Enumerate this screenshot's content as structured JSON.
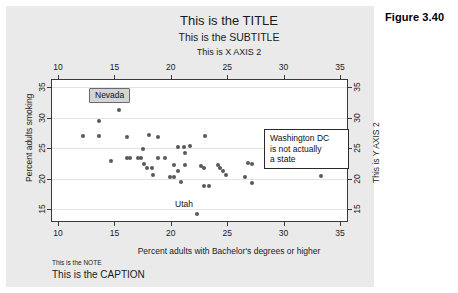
{
  "figure": {
    "number": "Figure 3.40",
    "title": "This is the TITLE",
    "subtitle": "This is the SUBTITLE",
    "note": "This is the NOTE",
    "caption": "This is the CAPTION"
  },
  "annotations": {
    "nevada": "Nevada",
    "utah": "Utah",
    "washington_dc": "Washington DC\nis not actually\na state",
    "washington_dc_lines": [
      "Washington DC",
      "is not actually",
      "a state"
    ]
  },
  "colors": {
    "panel_background": "#eaeaea",
    "plot_background": "#ffffff",
    "marker": "#595959",
    "axis": "#3a3a3a",
    "gridline": "#e3e3e3",
    "nevada_box_fill": "#d4d4d4",
    "nevada_box_border": "#6a6a6a",
    "dc_box_fill": "#ffffff",
    "dc_box_border": "#2a2a2a",
    "text": "#1a1a1a"
  },
  "chart_data": {
    "type": "scatter",
    "title": "This is the TITLE",
    "subtitle": "This is the SUBTITLE",
    "xlabel": "Percent adults with Bachelor's degrees or higher",
    "ylabel": "Percent adults smoking",
    "xlabel_top": "This is X AXIS 2",
    "ylabel_right": "This is Y AXIS 2",
    "xlim": [
      8.5,
      34.5
    ],
    "ylim": [
      13.2,
      36.5
    ],
    "xticks": [
      10,
      15,
      20,
      25,
      30,
      35
    ],
    "yticks": [
      15,
      20,
      25,
      30,
      35
    ],
    "xticks_top": [
      10,
      15,
      20,
      25,
      30,
      35
    ],
    "yticks_right": [
      15,
      20,
      25,
      30,
      35
    ],
    "grid": "horizontal",
    "legend": "none",
    "marker_color": "#595959",
    "marker_size": 4,
    "points": [
      {
        "x": 15.4,
        "y": 31.3,
        "label": "Nevada"
      },
      {
        "x": 13.6,
        "y": 29.5
      },
      {
        "x": 12.2,
        "y": 26.9
      },
      {
        "x": 13.6,
        "y": 26.9
      },
      {
        "x": 16.1,
        "y": 26.8
      },
      {
        "x": 18.1,
        "y": 27.2
      },
      {
        "x": 18.9,
        "y": 26.8
      },
      {
        "x": 23.0,
        "y": 26.9
      },
      {
        "x": 17.5,
        "y": 24.8
      },
      {
        "x": 20.6,
        "y": 25.1
      },
      {
        "x": 21.2,
        "y": 25.1
      },
      {
        "x": 21.7,
        "y": 25.3
      },
      {
        "x": 14.7,
        "y": 22.9
      },
      {
        "x": 16.1,
        "y": 23.4
      },
      {
        "x": 16.4,
        "y": 23.4
      },
      {
        "x": 17.1,
        "y": 23.4
      },
      {
        "x": 17.4,
        "y": 23.3
      },
      {
        "x": 18.9,
        "y": 23.4
      },
      {
        "x": 19.5,
        "y": 23.4
      },
      {
        "x": 21.3,
        "y": 24.1
      },
      {
        "x": 17.6,
        "y": 22.4
      },
      {
        "x": 17.9,
        "y": 21.8
      },
      {
        "x": 18.3,
        "y": 21.7
      },
      {
        "x": 20.3,
        "y": 22.2
      },
      {
        "x": 20.6,
        "y": 21.3
      },
      {
        "x": 21.3,
        "y": 22.2
      },
      {
        "x": 22.7,
        "y": 22.1
      },
      {
        "x": 22.9,
        "y": 21.7
      },
      {
        "x": 24.2,
        "y": 22.2
      },
      {
        "x": 24.4,
        "y": 21.8
      },
      {
        "x": 24.6,
        "y": 21.3
      },
      {
        "x": 26.8,
        "y": 22.5
      },
      {
        "x": 27.2,
        "y": 22.4
      },
      {
        "x": 18.4,
        "y": 20.5
      },
      {
        "x": 19.9,
        "y": 20.2
      },
      {
        "x": 20.3,
        "y": 20.2
      },
      {
        "x": 24.9,
        "y": 20.6
      },
      {
        "x": 26.6,
        "y": 20.2
      },
      {
        "x": 33.3,
        "y": 20.4
      },
      {
        "x": 20.9,
        "y": 19.5
      },
      {
        "x": 27.2,
        "y": 19.3
      },
      {
        "x": 22.9,
        "y": 18.7
      },
      {
        "x": 23.4,
        "y": 18.7
      },
      {
        "x": 22.3,
        "y": 14.1,
        "label": "Utah"
      }
    ]
  }
}
